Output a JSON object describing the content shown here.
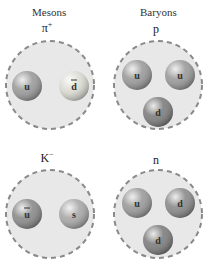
{
  "headers": {
    "mesons": "Mesons",
    "baryons": "Baryons"
  },
  "particles": [
    {
      "name": "pi-plus",
      "symbol": "π",
      "superscript": "+",
      "quarks": [
        {
          "label": "u",
          "antiquark": false,
          "color": "#9a9a9a"
        },
        {
          "label": "d",
          "antiquark": true,
          "color": "#dcdcd4"
        }
      ]
    },
    {
      "name": "proton",
      "symbol": "p",
      "superscript": "",
      "quarks": [
        {
          "label": "u",
          "antiquark": false,
          "color": "#9a9a9a"
        },
        {
          "label": "u",
          "antiquark": false,
          "color": "#9a9a9a"
        },
        {
          "label": "d",
          "antiquark": false,
          "color": "#7d7d7d"
        }
      ]
    },
    {
      "name": "k-minus",
      "symbol": "K",
      "superscript": "−",
      "quarks": [
        {
          "label": "u",
          "antiquark": true,
          "color": "#8a8a8a"
        },
        {
          "label": "s",
          "antiquark": false,
          "color": "#a8a8a8"
        }
      ]
    },
    {
      "name": "neutron",
      "symbol": "n",
      "superscript": "",
      "quarks": [
        {
          "label": "u",
          "antiquark": false,
          "color": "#9a9a9a"
        },
        {
          "label": "d",
          "antiquark": false,
          "color": "#8a8a8a"
        },
        {
          "label": "d",
          "antiquark": false,
          "color": "#7d7d7d"
        }
      ]
    }
  ],
  "colors": {
    "hadron_fill": "#e8e8e8",
    "hadron_border": "#8a8a8a"
  }
}
